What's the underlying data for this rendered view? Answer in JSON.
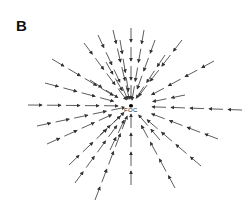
{
  "figure": {
    "panel_label": "B",
    "center_label": "FOC",
    "center": {
      "x": 131,
      "y": 106
    },
    "line_color": "#333333",
    "rays": [
      {
        "x": 131,
        "y": 28
      },
      {
        "x": 113,
        "y": 30
      },
      {
        "x": 144,
        "y": 30
      },
      {
        "x": 98,
        "y": 35
      },
      {
        "x": 155,
        "y": 40
      },
      {
        "x": 84,
        "y": 43
      },
      {
        "x": 182,
        "y": 40
      },
      {
        "x": 52,
        "y": 59
      },
      {
        "x": 45,
        "y": 83
      },
      {
        "x": 28,
        "y": 105
      },
      {
        "x": 37,
        "y": 126
      },
      {
        "x": 47,
        "y": 144
      },
      {
        "x": 214,
        "y": 61
      },
      {
        "x": 242,
        "y": 110
      },
      {
        "x": 218,
        "y": 139
      },
      {
        "x": 69,
        "y": 165
      },
      {
        "x": 75,
        "y": 183
      },
      {
        "x": 95,
        "y": 200
      },
      {
        "x": 131,
        "y": 185
      },
      {
        "x": 175,
        "y": 188
      },
      {
        "x": 201,
        "y": 166
      },
      {
        "x": 120,
        "y": 40
      },
      {
        "x": 106,
        "y": 62
      },
      {
        "x": 165,
        "y": 55
      },
      {
        "x": 90,
        "y": 80
      },
      {
        "x": 185,
        "y": 95
      },
      {
        "x": 100,
        "y": 135
      },
      {
        "x": 160,
        "y": 140
      },
      {
        "x": 110,
        "y": 150
      }
    ]
  }
}
